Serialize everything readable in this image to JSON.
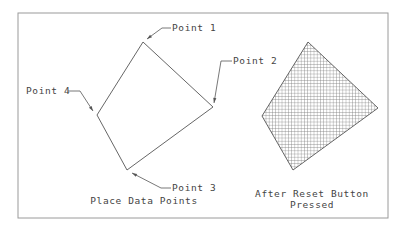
{
  "diagram": {
    "frame": {
      "x": 18,
      "y": 13,
      "width": 370,
      "height": 205,
      "color": "#9a9a9a"
    },
    "left_figure": {
      "caption": "Place Data Points",
      "vertices": [
        [
          143,
          42
        ],
        [
          213,
          107
        ],
        [
          127,
          170
        ],
        [
          97,
          115
        ]
      ],
      "points": [
        {
          "label": "Point 1",
          "label_x": 172,
          "label_y": 31,
          "leader": [
            [
              171,
              28
            ],
            [
              162,
              28
            ],
            [
              147,
              39
            ]
          ]
        },
        {
          "label": "Point 2",
          "label_x": 233,
          "label_y": 64,
          "leader": [
            [
              232,
              61
            ],
            [
              221,
              61
            ],
            [
              214,
              103
            ]
          ]
        },
        {
          "label": "Point 3",
          "label_x": 172,
          "label_y": 191,
          "leader": [
            [
              171,
              188
            ],
            [
              161,
              188
            ],
            [
              132,
              173
            ]
          ]
        },
        {
          "label": "Point 4",
          "label_x": 26,
          "label_y": 94,
          "leader": [
            [
              68,
              91
            ],
            [
              80,
              91
            ],
            [
              93,
              111
            ]
          ]
        }
      ]
    },
    "right_figure": {
      "caption_line1": "After Reset Button",
      "caption_line2": "Pressed",
      "vertices": [
        [
          308,
          42
        ],
        [
          378,
          108
        ],
        [
          293,
          170
        ],
        [
          262,
          116
        ]
      ],
      "hatch": "crosshatch"
    },
    "line_color": "#555555"
  }
}
